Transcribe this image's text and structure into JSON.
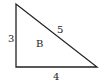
{
  "diagram": {
    "shape": "right-triangle",
    "name": "B",
    "sides": {
      "vertical": "3",
      "horizontal": "4",
      "hypotenuse": "5"
    },
    "vertices": {
      "top": [
        16,
        4
      ],
      "right_angle": [
        16,
        67
      ],
      "bottom_right": [
        97,
        67
      ]
    },
    "stroke_color": "#222222"
  }
}
